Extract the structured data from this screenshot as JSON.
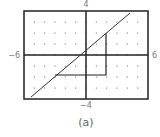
{
  "chart_data": {
    "type": "line",
    "title": "",
    "caption": "(a)",
    "xlim": [
      -6,
      6
    ],
    "ylim": [
      -4,
      4
    ],
    "tick_labels": {
      "xmin": "−6",
      "xmax": "6",
      "ymin": "−4",
      "ymax": "4"
    },
    "grid": "dots at integer points",
    "series": [
      {
        "name": "line",
        "points": [
          [
            -5.3,
            -3.8
          ],
          [
            4.3,
            3.8
          ]
        ]
      }
    ],
    "slope_triangle": {
      "horizontal": [
        [
          -3,
          -1.8
        ],
        [
          2,
          -1.8
        ]
      ],
      "vertical": [
        [
          2,
          -1.8
        ],
        [
          2,
          2
        ]
      ]
    }
  },
  "labels": {
    "ymax": "4",
    "ymin": "−4",
    "xmin": "−6",
    "xmax": "6",
    "caption": "(a)"
  }
}
